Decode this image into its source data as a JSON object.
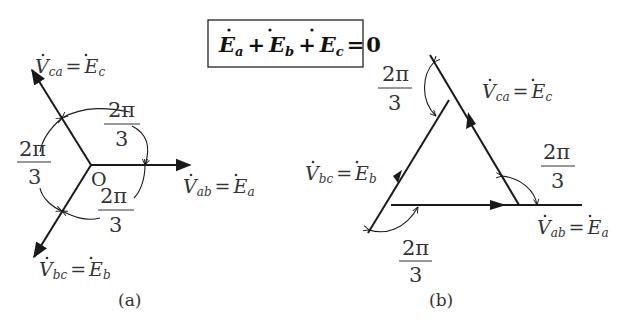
{
  "equation_box": {
    "E": "E",
    "sub_a": "a",
    "sub_b": "b",
    "sub_c": "c",
    "plus": "+",
    "equals": "=",
    "zero": "0"
  },
  "diagram_a": {
    "caption": "(a)",
    "origin_label": "O",
    "phasors": [
      {
        "lhs": "V",
        "lhs_sub": "ab",
        "rhs": "E",
        "rhs_sub": "a",
        "direction_deg": 0
      },
      {
        "lhs": "V",
        "lhs_sub": "ca",
        "rhs": "E",
        "rhs_sub": "c",
        "direction_deg": 120
      },
      {
        "lhs": "V",
        "lhs_sub": "bc",
        "rhs": "E",
        "rhs_sub": "b",
        "direction_deg": 240
      }
    ],
    "angle_labels": [
      {
        "num": "2π",
        "den": "3"
      },
      {
        "num": "2π",
        "den": "3"
      },
      {
        "num": "2π",
        "den": "3"
      }
    ]
  },
  "diagram_b": {
    "caption": "(b)",
    "phasors": [
      {
        "lhs": "V",
        "lhs_sub": "ab",
        "rhs": "E",
        "rhs_sub": "a"
      },
      {
        "lhs": "V",
        "lhs_sub": "ca",
        "rhs": "E",
        "rhs_sub": "c"
      },
      {
        "lhs": "V",
        "lhs_sub": "bc",
        "rhs": "E",
        "rhs_sub": "b"
      }
    ],
    "angle_labels": [
      {
        "num": "2π",
        "den": "3"
      },
      {
        "num": "2π",
        "den": "3"
      },
      {
        "num": "2π",
        "den": "3"
      }
    ]
  },
  "colors": {
    "line": "#1a1a1a",
    "text": "#333333",
    "background": "#ffffff"
  }
}
